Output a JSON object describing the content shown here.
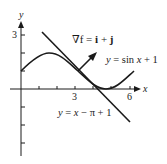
{
  "figure": {
    "axes": {
      "x_label": "x",
      "y_label": "y",
      "x_ticks": [
        1,
        2,
        3,
        4,
        5,
        6
      ],
      "x_tick_labels": {
        "3": "3",
        "6": "6"
      },
      "y_ticks": [
        -3,
        -2,
        -1,
        1,
        2,
        3
      ],
      "y_tick_labels": {
        "3": "3"
      }
    },
    "curves": [
      {
        "name": "sine-curve",
        "label": "y = sin x + 1",
        "equation": "y = sin x + 1"
      },
      {
        "name": "tangent-line",
        "label": "y = x − π + 1",
        "equation": "y = x - pi + 1"
      }
    ],
    "gradient": {
      "label_prefix": "∇f = ",
      "label_i": "i",
      "label_plus": " + ",
      "label_j": "j",
      "point": [
        3.14159,
        1
      ],
      "vector": [
        1,
        1
      ]
    },
    "labels": {
      "sin_y": "y",
      "sin_rest": " = sin ",
      "sin_x": "x",
      "sin_tail": " + 1",
      "tan_y": "y",
      "tan_eq": " = ",
      "tan_x": "x",
      "tan_tail": " − π + 1"
    },
    "colors": {
      "stroke": "#1a1a1a",
      "background": "#ffffff"
    }
  }
}
